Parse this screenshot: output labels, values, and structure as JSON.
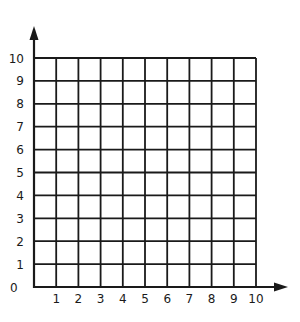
{
  "grid": {
    "x_min": 0,
    "x_max": 10,
    "y_min": 0,
    "y_max": 10,
    "line_color": "#1a1a1a",
    "background": "#ffffff"
  },
  "x_axis": {
    "tick_labels": [
      "1",
      "2",
      "3",
      "4",
      "5",
      "6",
      "7",
      "8",
      "9",
      "10"
    ],
    "origin_label": "0"
  },
  "y_axis": {
    "tick_labels": [
      "1",
      "2",
      "3",
      "4",
      "5",
      "6",
      "7",
      "8",
      "9",
      "10"
    ]
  }
}
